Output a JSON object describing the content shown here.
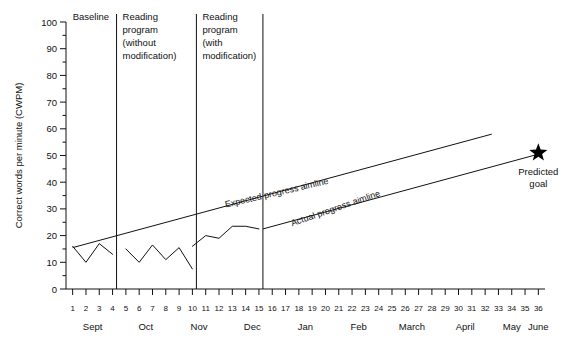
{
  "chart_data": {
    "type": "line",
    "title": "",
    "xlabel": "",
    "ylabel": "Correct words per minute (CWPM)",
    "ylim": [
      0,
      100
    ],
    "xlim": [
      0.5,
      36.5
    ],
    "ytick_labels": [
      "0",
      "10",
      "20",
      "30",
      "40",
      "50",
      "60",
      "70",
      "80",
      "90",
      "100"
    ],
    "ytick_values": [
      0,
      10,
      20,
      30,
      40,
      50,
      60,
      70,
      80,
      90,
      100
    ],
    "y_minor_step": 5,
    "grid": false,
    "legend": "none",
    "xtick_labels": [
      "1",
      "2",
      "3",
      "4",
      "5",
      "6",
      "7",
      "8",
      "9",
      "10",
      "11",
      "12",
      "13",
      "14",
      "15",
      "16",
      "17",
      "18",
      "19",
      "20",
      "21",
      "22",
      "23",
      "24",
      "25",
      "26",
      "27",
      "28",
      "29",
      "30",
      "31",
      "32",
      "33",
      "34",
      "35",
      "36"
    ],
    "xtick_values": [
      1,
      2,
      3,
      4,
      5,
      6,
      7,
      8,
      9,
      10,
      11,
      12,
      13,
      14,
      15,
      16,
      17,
      18,
      19,
      20,
      21,
      22,
      23,
      24,
      25,
      26,
      27,
      28,
      29,
      30,
      31,
      32,
      33,
      34,
      35,
      36
    ],
    "month_labels": [
      {
        "label": "Sept",
        "center_week": 2.5
      },
      {
        "label": "Oct",
        "center_week": 6.5
      },
      {
        "label": "Nov",
        "center_week": 10.5
      },
      {
        "label": "Dec",
        "center_week": 14.5
      },
      {
        "label": "Jan",
        "center_week": 18.5
      },
      {
        "label": "Feb",
        "center_week": 22.5
      },
      {
        "label": "March",
        "center_week": 26.5
      },
      {
        "label": "April",
        "center_week": 30.5
      },
      {
        "label": "May",
        "center_week": 34.0
      },
      {
        "label": "June",
        "center_week": 36.0
      }
    ],
    "phases": [
      {
        "label": "Baseline",
        "label_lines": [
          "Baseline"
        ],
        "start_week": 1,
        "end_week": 4,
        "divider_week": 4.3
      },
      {
        "label": "Reading program (without modification)",
        "label_lines": [
          "Reading",
          "program",
          "(without",
          "modification)"
        ],
        "start_week": 5,
        "end_week": 10,
        "divider_week": 10.3
      },
      {
        "label": "Reading program (with modification)",
        "label_lines": [
          "Reading",
          "program",
          "(with",
          "modification)"
        ],
        "start_week": 11,
        "end_week": 15,
        "divider_week": 15.3
      }
    ],
    "series": [
      {
        "name": "Baseline data",
        "x": [
          1,
          2,
          3,
          4
        ],
        "values": [
          16,
          10,
          17,
          13
        ]
      },
      {
        "name": "Reading program without modification data",
        "x": [
          5,
          6,
          7,
          8,
          9,
          10
        ],
        "values": [
          15,
          10,
          16.5,
          11,
          15.5,
          7.5
        ]
      },
      {
        "name": "Reading program with modification data",
        "x": [
          10,
          11,
          12,
          13,
          14,
          15
        ],
        "values": [
          16,
          20,
          19,
          23.5,
          23.5,
          22.5
        ]
      }
    ],
    "aimlines": [
      {
        "name": "Expected progress aimline",
        "label": "Expected progress aimline",
        "x": [
          1,
          32.5
        ],
        "values": [
          15.5,
          58
        ],
        "label_week": 12.5,
        "label_value": 30.5,
        "label_rotation": -13
      },
      {
        "name": "Actual progress aimline",
        "label": "Actual progress aimline",
        "x": [
          15.3,
          36
        ],
        "values": [
          22.5,
          50.5
        ],
        "label_week": 17.5,
        "label_value": 23.5,
        "label_rotation": -19
      }
    ],
    "annotations": [
      {
        "name": "predicted-goal",
        "marker": "star",
        "label_lines": [
          "Predicted",
          "goal"
        ],
        "x": 36,
        "value": 51
      }
    ],
    "colors": {
      "axis": "#111111",
      "data_line": "#111111",
      "aimline": "#111111",
      "goal_marker": "#000000",
      "background": "#ffffff"
    }
  }
}
